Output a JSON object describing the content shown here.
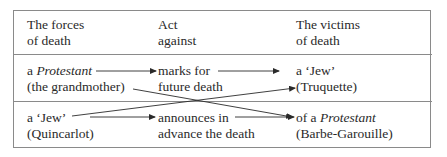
{
  "headers": [
    {
      "line1": "The forces",
      "line2": "of death"
    },
    {
      "line1": "Act",
      "line2": "against"
    },
    {
      "line1": "The victims",
      "line2": "of death"
    }
  ],
  "rows": [
    {
      "force": {
        "prefix": "a ",
        "emph": "Protestant",
        "line2": "(the grandmother)"
      },
      "act": {
        "line1": "marks for",
        "line2": "future death"
      },
      "victim": {
        "line1": "a ‘Jew’",
        "line2": "(Truquette)"
      }
    },
    {
      "force": {
        "line1": "a ‘Jew’",
        "line2": "(Quincarlot)"
      },
      "act": {
        "line1": "announces in",
        "line2": "advance the death"
      },
      "victim": {
        "prefix": "of a ",
        "emph": "Protestant",
        "line2": "(Barbe-Garouille)"
      }
    }
  ],
  "arrows": [
    {
      "from": "a Protestant",
      "to": "marks for"
    },
    {
      "from": "marks for",
      "to": "a ‘Jew’ (Truquette)"
    },
    {
      "from": "(the grandmother)",
      "to": "of a Protestant (Barbe-Garouille)"
    },
    {
      "from": "a ‘Jew’ (Quincarlot)",
      "to": "(Truquette)"
    },
    {
      "from": "a ‘Jew’ (Quincarlot)",
      "to": "announces in"
    },
    {
      "from": "announces in",
      "to": "of a Protestant"
    }
  ],
  "colors": {
    "line": "#8a8a8a",
    "text": "#2a2a2a",
    "arrow": "#2a2a2a"
  }
}
